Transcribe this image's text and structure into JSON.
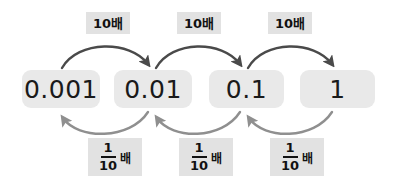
{
  "diagram": {
    "type": "decimal-place-value-chain",
    "background_color": "#ffffff",
    "value_box_color": "#e9e9e9",
    "chip_color": "#e2e2e2",
    "forward_arrow_color": "#4a4a4a",
    "backward_arrow_color": "#8f8f8f",
    "text_color": "#111111",
    "values": [
      {
        "label": "0.001"
      },
      {
        "label": "0.01"
      },
      {
        "label": "0.1"
      },
      {
        "label": "1"
      }
    ],
    "forward_labels": [
      {
        "text": "10배"
      },
      {
        "text": "10배"
      },
      {
        "text": "10배"
      }
    ],
    "backward_labels": [
      {
        "numerator": "1",
        "denominator": "10",
        "unit": "배"
      },
      {
        "numerator": "1",
        "denominator": "10",
        "unit": "배"
      },
      {
        "numerator": "1",
        "denominator": "10",
        "unit": "배"
      }
    ]
  }
}
